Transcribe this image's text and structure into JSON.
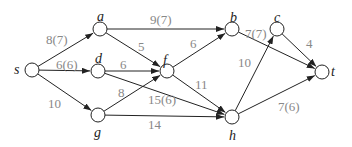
{
  "diagram": {
    "type": "flow-network",
    "nodes": [
      {
        "id": "s",
        "label": "s",
        "x": 32,
        "y": 70,
        "lx": 14,
        "ly": 63
      },
      {
        "id": "a",
        "label": "a",
        "x": 100,
        "y": 29,
        "lx": 97,
        "ly": 10
      },
      {
        "id": "d",
        "label": "d",
        "x": 98,
        "y": 71,
        "lx": 95,
        "ly": 52
      },
      {
        "id": "g",
        "label": "g",
        "x": 98,
        "y": 115,
        "lx": 94,
        "ly": 126
      },
      {
        "id": "f",
        "label": "f",
        "x": 167,
        "y": 71,
        "lx": 163,
        "ly": 54
      },
      {
        "id": "b",
        "label": "b",
        "x": 232,
        "y": 29,
        "lx": 230,
        "ly": 11
      },
      {
        "id": "c",
        "label": "c",
        "x": 277,
        "y": 29,
        "lx": 274,
        "ly": 11
      },
      {
        "id": "h",
        "label": "h",
        "x": 232,
        "y": 117,
        "lx": 229,
        "ly": 129
      },
      {
        "id": "t",
        "label": "t",
        "x": 322,
        "y": 72,
        "lx": 331,
        "ly": 65
      }
    ],
    "edges": [
      {
        "from": "s",
        "to": "a",
        "label": "8(7)",
        "lx": 46,
        "ly": 33
      },
      {
        "from": "s",
        "to": "d",
        "label": "6(6)",
        "lx": 56,
        "ly": 58
      },
      {
        "from": "s",
        "to": "g",
        "label": "10",
        "lx": 48,
        "ly": 97
      },
      {
        "from": "a",
        "to": "b",
        "label": "9(7)",
        "lx": 150,
        "ly": 13
      },
      {
        "from": "a",
        "to": "f",
        "label": "5",
        "lx": 138,
        "ly": 40
      },
      {
        "from": "d",
        "to": "f",
        "label": "6",
        "lx": 120,
        "ly": 58
      },
      {
        "from": "d",
        "to": "h",
        "label": "15(6)",
        "lx": 148,
        "ly": 93
      },
      {
        "from": "g",
        "to": "f",
        "label": "8",
        "lx": 118,
        "ly": 86
      },
      {
        "from": "g",
        "to": "h",
        "label": "14",
        "lx": 148,
        "ly": 118
      },
      {
        "from": "f",
        "to": "b",
        "label": "6",
        "lx": 190,
        "ly": 37
      },
      {
        "from": "f",
        "to": "h",
        "label": "11",
        "lx": 195,
        "ly": 78
      },
      {
        "from": "h",
        "to": "c",
        "label": "10",
        "lx": 238,
        "ly": 56
      },
      {
        "from": "b",
        "to": "t",
        "label": "7(7)",
        "lx": 245,
        "ly": 27
      },
      {
        "from": "c",
        "to": "t",
        "label": "4",
        "lx": 306,
        "ly": 37
      },
      {
        "from": "h",
        "to": "t",
        "label": "7(6)",
        "lx": 278,
        "ly": 100
      }
    ]
  }
}
